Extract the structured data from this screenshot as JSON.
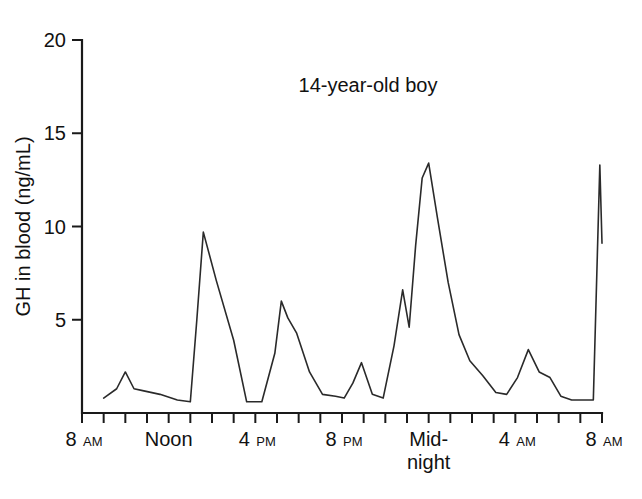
{
  "chart_data": {
    "type": "line",
    "title": "14-year-old boy",
    "xlabel": "",
    "ylabel": "GH in blood (ng/mL)",
    "ylim": [
      0,
      20
    ],
    "xlim": [
      8,
      32
    ],
    "grid": false,
    "legend": "none",
    "y_ticks": [
      5,
      10,
      15,
      20
    ],
    "y_tick_labels": [
      "5",
      "10",
      "15",
      "20"
    ],
    "x_ticks_hours": [
      8,
      9,
      10,
      11,
      12,
      13,
      14,
      15,
      16,
      17,
      18,
      19,
      20,
      21,
      22,
      23,
      24,
      25,
      26,
      27,
      28,
      29,
      30,
      31,
      32
    ],
    "x_labeled_ticks": [
      {
        "hour": 8,
        "label": "8",
        "suffix": "AM",
        "second_line": ""
      },
      {
        "hour": 12,
        "label": "Noon",
        "suffix": "",
        "second_line": ""
      },
      {
        "hour": 16,
        "label": "4",
        "suffix": "PM",
        "second_line": ""
      },
      {
        "hour": 20,
        "label": "8",
        "suffix": "PM",
        "second_line": ""
      },
      {
        "hour": 24,
        "label": "Mid-",
        "suffix": "",
        "second_line": "night"
      },
      {
        "hour": 28,
        "label": "4",
        "suffix": "AM",
        "second_line": ""
      },
      {
        "hour": 32,
        "label": "8",
        "suffix": "AM",
        "second_line": ""
      }
    ],
    "series": [
      {
        "name": "GH concentration",
        "color": "#2a2a2a",
        "x": [
          9.0,
          9.6,
          10.0,
          10.4,
          10.8,
          11.6,
          12.4,
          13.0,
          13.3,
          13.6,
          14.2,
          15.0,
          15.6,
          16.3,
          16.9,
          17.2,
          17.5,
          17.9,
          18.5,
          19.1,
          19.7,
          20.1,
          20.5,
          20.9,
          21.4,
          21.9,
          22.4,
          22.8,
          23.1,
          23.4,
          23.7,
          24.0,
          24.4,
          24.9,
          25.4,
          25.9,
          26.5,
          27.1,
          27.6,
          28.1,
          28.6,
          29.1,
          29.6,
          30.1,
          30.6,
          31.1,
          31.6,
          31.9,
          32.0
        ],
        "y": [
          0.8,
          1.3,
          2.2,
          1.3,
          1.2,
          1.0,
          0.7,
          0.6,
          5.0,
          9.7,
          7.1,
          3.9,
          0.6,
          0.6,
          3.2,
          6.0,
          5.1,
          4.3,
          2.2,
          1.0,
          0.9,
          0.8,
          1.6,
          2.7,
          1.0,
          0.8,
          3.6,
          6.6,
          4.6,
          9.0,
          12.6,
          13.4,
          10.5,
          7.0,
          4.2,
          2.8,
          2.0,
          1.1,
          1.0,
          1.9,
          3.4,
          2.2,
          1.9,
          0.9,
          0.7,
          0.7,
          0.7,
          13.3,
          9.1
        ]
      }
    ],
    "annotations": [
      {
        "text": "14-year-old boy",
        "x_hour": 21.2,
        "y_value": 17.2
      }
    ],
    "notable_peaks": [
      {
        "time": "10 AM",
        "value": 2.2
      },
      {
        "time": "1:30 PM",
        "value": 9.7
      },
      {
        "time": "5:15 PM",
        "value": 6.0
      },
      {
        "time": "8:55 PM",
        "value": 2.7
      },
      {
        "time": "10:50 PM",
        "value": 6.6
      },
      {
        "time": "Midnight",
        "value": 13.4
      },
      {
        "time": "4:35 AM",
        "value": 3.4
      },
      {
        "time": "8 AM",
        "value": 13.3
      }
    ],
    "baseline_value": 0.6
  }
}
